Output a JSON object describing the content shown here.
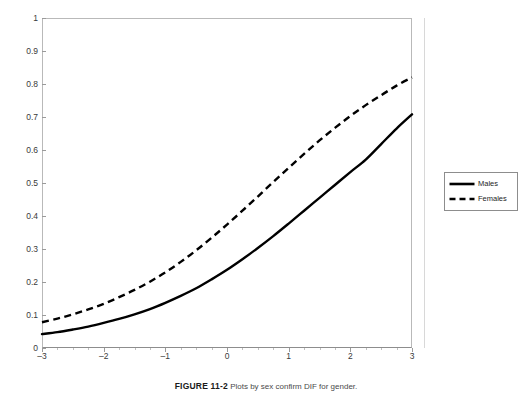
{
  "chart_data": {
    "type": "line",
    "title": "",
    "subtitle": "",
    "xlabel": "",
    "ylabel": "",
    "xlim": [
      -3,
      3
    ],
    "ylim": [
      0,
      1
    ],
    "grid": false,
    "legend_position": "right",
    "x_ticks": [
      -3,
      -2,
      -1,
      0,
      1,
      2,
      3
    ],
    "x_tick_labels": [
      "–3",
      "–2",
      "–1",
      "0",
      "1",
      "2",
      "3"
    ],
    "y_ticks": [
      0,
      0.1,
      0.2,
      0.3,
      0.4,
      0.5,
      0.6,
      0.7,
      0.8,
      0.9,
      1
    ],
    "y_tick_labels": [
      "0",
      "0.1",
      "0.2",
      "0.3",
      "0.4",
      "0.5",
      "0.6",
      "0.7",
      "0.8",
      "0.9",
      "1"
    ],
    "x": [
      -3,
      -2.75,
      -2.5,
      -2.25,
      -2,
      -1.75,
      -1.5,
      -1.25,
      -1,
      -0.75,
      -0.5,
      -0.25,
      0,
      0.25,
      0.5,
      0.75,
      1,
      1.25,
      1.5,
      1.75,
      2,
      2.25,
      2.5,
      2.75,
      3
    ],
    "series": [
      {
        "name": "Males",
        "style": "solid",
        "color": "#000000",
        "values": [
          0.042,
          0.048,
          0.056,
          0.065,
          0.076,
          0.088,
          0.102,
          0.118,
          0.137,
          0.158,
          0.181,
          0.208,
          0.237,
          0.269,
          0.303,
          0.339,
          0.377,
          0.416,
          0.455,
          0.494,
          0.533,
          0.571,
          0.618,
          0.665,
          0.708
        ]
      },
      {
        "name": "Females",
        "style": "dashed",
        "color": "#000000",
        "values": [
          0.078,
          0.089,
          0.102,
          0.117,
          0.134,
          0.154,
          0.176,
          0.201,
          0.229,
          0.261,
          0.296,
          0.334,
          0.374,
          0.416,
          0.459,
          0.503,
          0.546,
          0.588,
          0.629,
          0.667,
          0.703,
          0.736,
          0.766,
          0.795,
          0.82
        ]
      }
    ]
  },
  "legend": {
    "items": [
      {
        "label": "Males",
        "style": "solid"
      },
      {
        "label": "Females",
        "style": "dashed"
      }
    ]
  },
  "caption": {
    "number": "FIGURE 11-2",
    "text": "Plots by sex confirm DIF for gender."
  }
}
